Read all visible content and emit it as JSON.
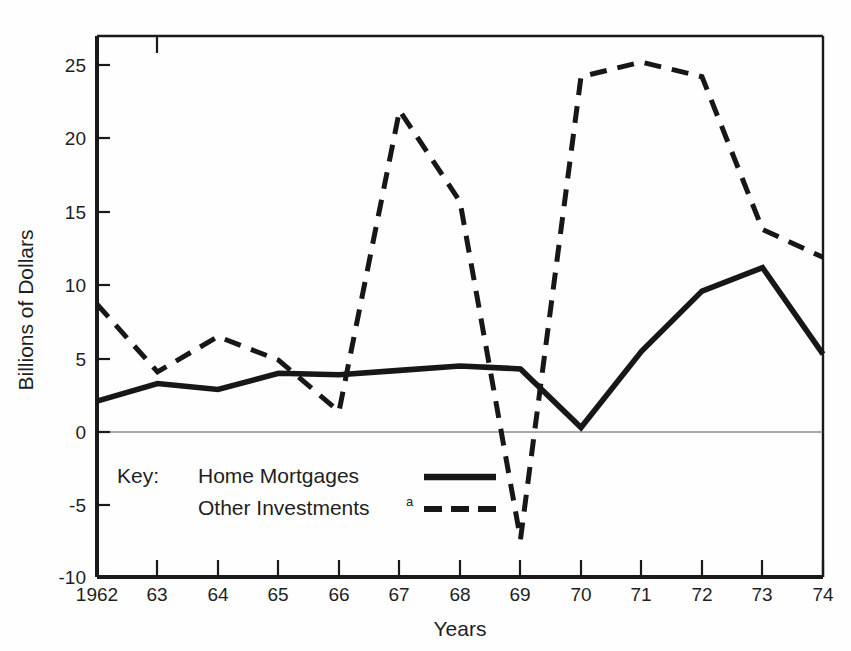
{
  "chart_data": {
    "type": "line",
    "title": "",
    "xlabel": "Years",
    "ylabel": "Billions of Dollars",
    "x": [
      1962,
      1963,
      1964,
      1965,
      1966,
      1967,
      1968,
      1969,
      1970,
      1971,
      1972,
      1973,
      1974
    ],
    "xtick_labels": [
      "1962",
      "63",
      "64",
      "65",
      "66",
      "67",
      "68",
      "69",
      "70",
      "71",
      "72",
      "73",
      "74"
    ],
    "ytick_labels": [
      "25",
      "20",
      "15",
      "10",
      "5",
      "0",
      "-5",
      "-10"
    ],
    "yticks": [
      25,
      20,
      15,
      10,
      5,
      0,
      -5,
      -10
    ],
    "ylim": [
      -10,
      27.5
    ],
    "xlim": [
      1962,
      1974
    ],
    "grid": false,
    "legend_position": "inside-lower-left",
    "series": [
      {
        "name": "Home Mortgages",
        "style": "solid",
        "color": "#17171a",
        "values": [
          2.1,
          3.3,
          2.9,
          4.0,
          3.9,
          4.2,
          4.5,
          4.3,
          0.3,
          5.5,
          9.6,
          11.2,
          5.3
        ]
      },
      {
        "name": "Other Investments",
        "style": "dashed",
        "color": "#17171a",
        "footnote_marker": "a",
        "values": [
          8.7,
          4.1,
          6.5,
          4.9,
          1.4,
          21.9,
          15.7,
          -7.3,
          24.2,
          25.2,
          24.2,
          13.8,
          11.9
        ]
      }
    ]
  },
  "legend": {
    "key_label": "Key:",
    "entries": [
      {
        "label": "Home Mortgages",
        "marker": "solid-line-swatch",
        "sup": ""
      },
      {
        "label": "Other Investments",
        "marker": "dashed-line-swatch",
        "sup": "a"
      }
    ]
  },
  "axes": {
    "y_title": "Billions of Dollars",
    "x_title": "Years"
  }
}
